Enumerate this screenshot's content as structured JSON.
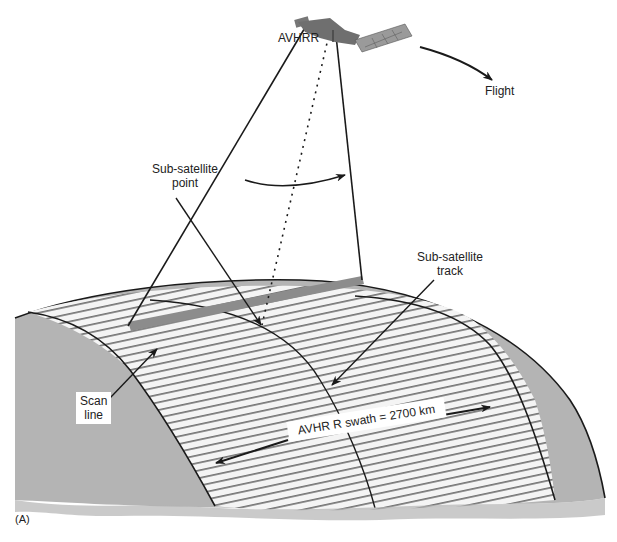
{
  "figure": {
    "panel_label": "(A)",
    "colors": {
      "earth_gray": "#b4b4b4",
      "scan_line_gray": "#8c8c8c",
      "line": "#1a1a1a",
      "background": "#ffffff"
    }
  },
  "labels": {
    "sensor": "AVHRR",
    "flight": "Flight",
    "sub_satellite_point_line1": "Sub-satellite",
    "sub_satellite_point_line2": "point",
    "sub_satellite_track_line1": "Sub-satellite",
    "sub_satellite_track_line2": "track",
    "scan_line_line1": "Scan",
    "scan_line_line2": "line",
    "swath": "AVHR R swath = 2700 km"
  },
  "icons": {
    "satellite": "satellite-icon",
    "flight_arrow": "curved-arrow-icon"
  }
}
